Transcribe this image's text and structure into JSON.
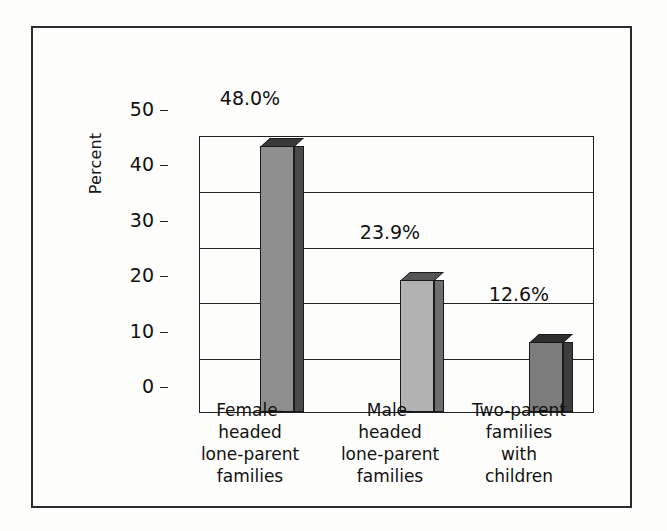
{
  "figure": {
    "background_color": "#fdfdfc",
    "frame_color": "#2b2b2b"
  },
  "chart_data": {
    "type": "bar",
    "title": "",
    "subtitle": "",
    "xlabel": "",
    "ylabel": "Percent",
    "ylim": [
      0,
      50
    ],
    "yticks": [
      0,
      10,
      20,
      30,
      40,
      50
    ],
    "ytick_labels": [
      "0",
      "10",
      "20",
      "30",
      "40",
      "50"
    ],
    "grid": true,
    "grid_axis": "y",
    "legend": false,
    "legend_position": "none",
    "style": "3d-extruded-bars",
    "categories": [
      "Female-headed lone-parent families",
      "Male-headed lone-parent families",
      "Two-parent families with children"
    ],
    "category_lines": [
      [
        "Female-",
        "headed",
        "lone-parent",
        "families"
      ],
      [
        "Male-",
        "headed",
        "lone-parent",
        "families"
      ],
      [
        "Two-parent",
        "families",
        "with",
        "children"
      ]
    ],
    "values": [
      48.0,
      23.9,
      12.6
    ],
    "value_labels": [
      "48.0%",
      "23.9%",
      "12.6%"
    ],
    "bar_colors": [
      "#8e8e8e",
      "#b2b2b2",
      "#7c7c7c"
    ],
    "bar_side_colors": [
      "#4a4a4a",
      "#6e6e6e",
      "#3d3d3d"
    ],
    "bar_top_colors": [
      "#3a3a3a",
      "#555555",
      "#2e2e2e"
    ]
  }
}
